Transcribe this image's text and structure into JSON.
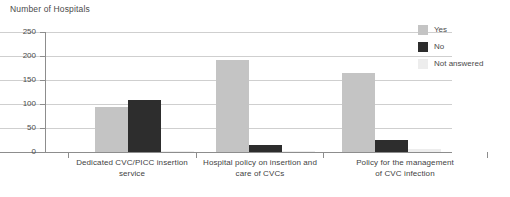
{
  "chart_data": {
    "type": "bar",
    "title": "Number of Hospitals",
    "xlabel": "",
    "ylabel": "Number of Hospitals",
    "ylim": [
      0,
      250
    ],
    "yticks": [
      0,
      50,
      100,
      150,
      200,
      250
    ],
    "grid": true,
    "legend_position": "right",
    "categories": [
      "Dedicated CVC/PICC insertion service",
      "Hospital policy on insertion and care of CVCs",
      "Policy for the management of CVC infection"
    ],
    "category_lines": [
      [
        "Dedicated CVC/PICC insertion",
        "service"
      ],
      [
        "Hospital policy on insertion and",
        "care of CVCs"
      ],
      [
        "Policy for the management",
        "of CVC infection"
      ]
    ],
    "series": [
      {
        "name": "Yes",
        "color": "#c4c4c4",
        "values": [
          93,
          192,
          165
        ]
      },
      {
        "name": "No",
        "color": "#2d2d2d",
        "values": [
          108,
          15,
          25
        ]
      },
      {
        "name": "Not answered",
        "color": "#ededed",
        "values": [
          2,
          2,
          6
        ]
      }
    ]
  },
  "legend": {
    "items": [
      {
        "label": "Yes"
      },
      {
        "label": "No"
      },
      {
        "label": "Not answered"
      }
    ]
  },
  "axis": {
    "tick_labels": [
      "250",
      "200",
      "150",
      "100",
      "50",
      "0"
    ]
  }
}
